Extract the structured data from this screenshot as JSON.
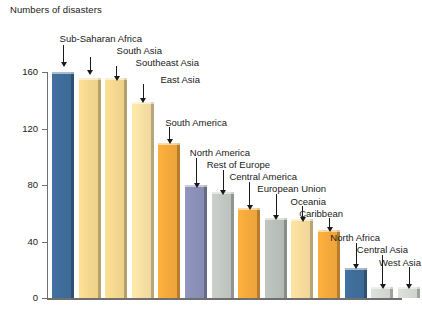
{
  "chart_data": {
    "type": "bar",
    "title": "Numbers of disasters",
    "xlabel": "",
    "ylabel": "",
    "ylim": [
      0,
      160
    ],
    "yticks": [
      0,
      40,
      80,
      120,
      160
    ],
    "ytick_labels": [
      "0",
      "40",
      "80",
      "120",
      "160"
    ],
    "grid": false,
    "legend": "none",
    "annotations": "Each bar is labelled by a text callout with a downward arrow pointing at the bar.",
    "categories": [
      "Sub-Saharan Africa",
      "South Asia",
      "Southeast Asia",
      "East Asia",
      "South America",
      "North America",
      "Rest of Europe",
      "Central America",
      "European Union",
      "Oceania",
      "Caribbean",
      "North Africa",
      "Central Asia",
      "West Asia"
    ],
    "values": [
      160,
      156,
      156,
      139,
      110,
      80,
      75,
      64,
      57,
      56,
      48,
      21,
      8,
      8
    ],
    "colors": [
      "#3f6d9a",
      "#f5d88f",
      "#f5d88f",
      "#f7e0a4",
      "#f5a93c",
      "#8b90b8",
      "#c3c8c4",
      "#f5a93c",
      "#b9bfbb",
      "#f7dc9d",
      "#f5a93c",
      "#3f6d9a",
      "#d6d9d4",
      "#d6d9d4"
    ]
  },
  "palette": {
    "dark_blue": "#3f6d9a",
    "light_yellow": "#f5d88f",
    "orange": "#f5a93c",
    "purple_gray": "#8b90b8",
    "gray": "#c3c8c4",
    "axis": "#6f6f6f",
    "text": "#1a1a1a",
    "background": "#ffffff"
  }
}
